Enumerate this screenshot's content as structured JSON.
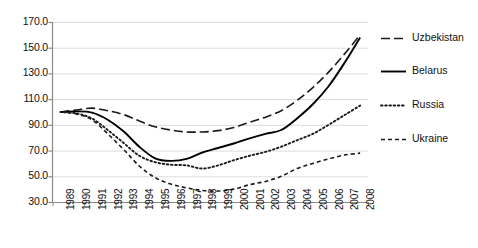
{
  "chart_data": {
    "type": "line",
    "title": "",
    "xlabel": "",
    "ylabel": "",
    "x": [
      1989,
      1990,
      1991,
      1992,
      1993,
      1994,
      1995,
      1996,
      1997,
      1998,
      1999,
      2000,
      2001,
      2002,
      2003,
      2004,
      2005,
      2006,
      2007,
      2008
    ],
    "categories": [
      "1989",
      "1990",
      "1991",
      "1992",
      "1993",
      "1994",
      "1995",
      "1996",
      "1997",
      "1998",
      "1999",
      "2000",
      "2001",
      "2002",
      "2003",
      "2004",
      "2005",
      "2006",
      "2007",
      "2008"
    ],
    "ylim": [
      30.0,
      170.0
    ],
    "yticks": [
      "30.0",
      "50.0",
      "70.0",
      "90.0",
      "110.0",
      "130.0",
      "150.0",
      "170.0"
    ],
    "ytick_values": [
      30.0,
      50.0,
      70.0,
      90.0,
      110.0,
      130.0,
      150.0,
      170.0
    ],
    "grid": "horizontal",
    "legend_position": "right",
    "series": [
      {
        "name": "Uzbekistan",
        "style": "long-dash",
        "color": "#1a1a1a",
        "values": [
          100.0,
          101.5,
          103.0,
          101.0,
          98.0,
          93.0,
          88.5,
          86.0,
          84.5,
          84.5,
          85.5,
          88.0,
          92.0,
          96.0,
          101.0,
          109.0,
          119.0,
          131.0,
          145.0,
          160.0
        ]
      },
      {
        "name": "Belarus",
        "style": "solid",
        "color": "#000000",
        "values": [
          100.0,
          100.5,
          99.5,
          94.0,
          85.0,
          73.0,
          64.0,
          62.0,
          63.5,
          68.5,
          72.0,
          75.5,
          79.5,
          83.0,
          86.0,
          95.0,
          106.0,
          120.0,
          138.0,
          158.0
        ]
      },
      {
        "name": "Russia",
        "style": "dotted",
        "color": "#1a1a1a",
        "values": [
          100.0,
          99.0,
          95.0,
          86.0,
          76.0,
          66.0,
          61.0,
          59.0,
          58.5,
          56.0,
          58.5,
          62.5,
          66.0,
          69.0,
          73.0,
          78.0,
          83.0,
          90.0,
          97.5,
          105.0
        ]
      },
      {
        "name": "Ukraine",
        "style": "short-dash",
        "color": "#1a1a1a",
        "values": [
          100.0,
          98.5,
          94.0,
          83.0,
          71.0,
          58.0,
          49.0,
          44.0,
          41.0,
          39.0,
          38.5,
          40.0,
          43.5,
          46.0,
          50.0,
          56.0,
          60.0,
          63.5,
          66.5,
          68.0
        ]
      }
    ]
  },
  "legend": {
    "items": [
      {
        "label": "Uzbekistan",
        "swatch": "long-dash-swatch"
      },
      {
        "label": "Belarus",
        "swatch": "solid-line-swatch"
      },
      {
        "label": "Russia",
        "swatch": "dotted-line-swatch"
      },
      {
        "label": "Ukraine",
        "swatch": "short-dash-swatch"
      }
    ]
  }
}
